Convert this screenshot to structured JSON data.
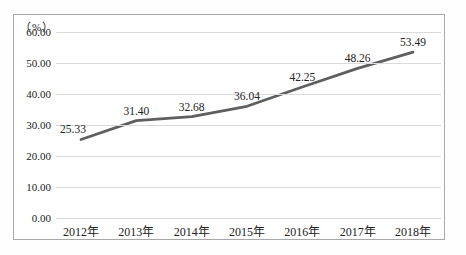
{
  "chart": {
    "unit_label": "（%）"
  },
  "chart_data": {
    "type": "line",
    "categories": [
      "2012年",
      "2013年",
      "2014年",
      "2015年",
      "2016年",
      "2017年",
      "2018年"
    ],
    "values": [
      25.33,
      31.4,
      32.68,
      36.04,
      42.25,
      48.26,
      53.49
    ],
    "value_labels": [
      "25.33",
      "31.40",
      "32.68",
      "36.04",
      "42.25",
      "48.26",
      "53.49"
    ],
    "title": "",
    "xlabel": "",
    "ylabel": "（%）",
    "y_ticks": [
      "0.00",
      "10.00",
      "20.00",
      "30.00",
      "40.00",
      "50.00",
      "60.00"
    ],
    "ylim": [
      0,
      60
    ],
    "grid": "horizontal",
    "legend": "none",
    "line_color": "#5f5f5f",
    "gridline_color": "#dadada",
    "frame_border_color": "#a8a8a8",
    "text_color": "#222222"
  }
}
